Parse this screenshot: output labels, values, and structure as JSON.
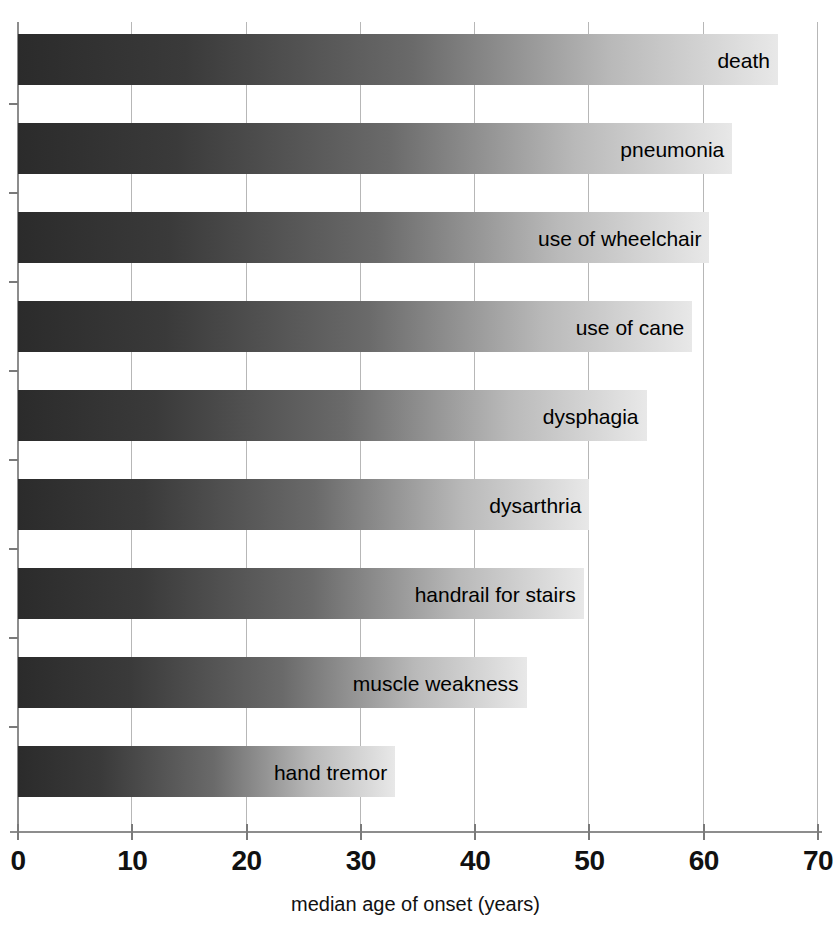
{
  "chart_data": {
    "type": "bar",
    "orientation": "horizontal",
    "title": "",
    "xlabel": "median age of onset (years)",
    "ylabel": "",
    "xlim": [
      0,
      70
    ],
    "xticks": [
      0,
      10,
      20,
      30,
      40,
      50,
      60,
      70
    ],
    "xtick_labels": [
      "0",
      "10",
      "20",
      "30",
      "40",
      "50",
      "60",
      "70"
    ],
    "grid": "vertical",
    "legend": "none",
    "bar_style": {
      "fill": "horizontal grayscale gradient, dark left to light right",
      "color_start": "#2b2b2b",
      "color_end": "#e8e8e8"
    },
    "categories": [
      "death",
      "pneumonia",
      "use of wheelchair",
      "use of cane",
      "dysphagia",
      "dysarthria",
      "handrail for stairs",
      "muscle weakness",
      "hand tremor"
    ],
    "values": [
      66.5,
      62.5,
      60.5,
      59,
      55,
      50,
      49.5,
      44.5,
      33
    ]
  }
}
